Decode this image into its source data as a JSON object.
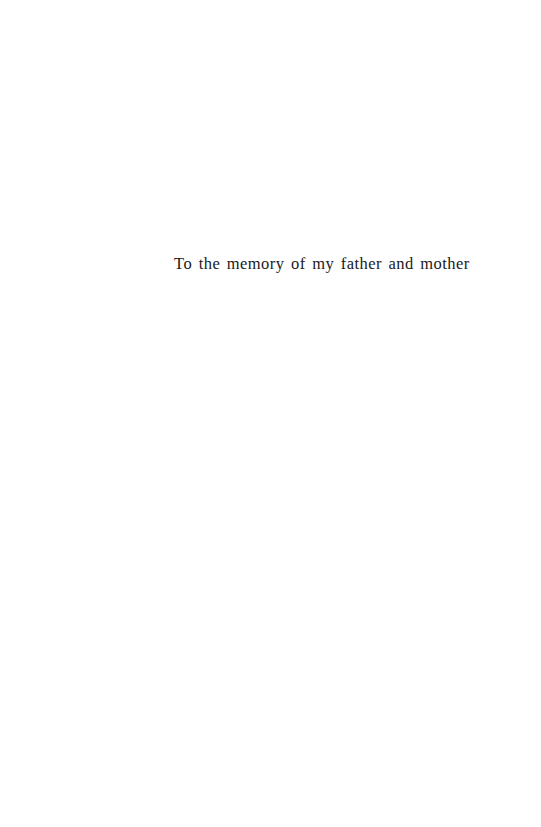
{
  "page": {
    "dedication": "To the memory of my father and mother"
  }
}
